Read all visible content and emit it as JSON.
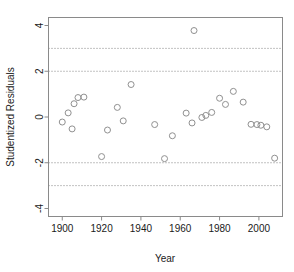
{
  "chart_data": {
    "type": "scatter",
    "title": "",
    "xlabel": "Year",
    "ylabel": "Studentized Residuals",
    "xlim": [
      1893,
      2012
    ],
    "ylim": [
      -4.35,
      4.35
    ],
    "xticks": [
      1900,
      1920,
      1940,
      1960,
      1980,
      2000
    ],
    "xtick_labels": [
      "1900",
      "1920",
      "1940",
      "1960",
      "1980",
      "2000"
    ],
    "yticks": [
      4,
      2,
      0,
      -2,
      -4
    ],
    "ytick_labels": [
      "4",
      "2",
      "0",
      "-2",
      "-4"
    ],
    "grid": false,
    "legend": null,
    "reference_lines": [
      {
        "y": 3,
        "style": "dotted",
        "color": "#777777"
      },
      {
        "y": 2,
        "style": "dotted",
        "color": "#777777"
      },
      {
        "y": -2,
        "style": "dotted",
        "color": "#777777"
      },
      {
        "y": -3,
        "style": "dotted",
        "color": "#777777"
      }
    ],
    "marker": {
      "shape": "open-circle",
      "radius_px": 3,
      "color": "#909090"
    },
    "x": [
      1900,
      1903,
      1905,
      1906,
      1908,
      1911,
      1920,
      1923,
      1928,
      1931,
      1935,
      1947,
      1952,
      1956,
      1963,
      1966,
      1967,
      1971,
      1973,
      1976,
      1980,
      1983,
      1987,
      1992,
      1996,
      1999,
      2001,
      2004,
      2008
    ],
    "y": [
      -0.22,
      0.18,
      -0.52,
      0.58,
      0.85,
      0.87,
      -1.73,
      -0.57,
      0.42,
      -0.17,
      1.42,
      -0.33,
      -1.82,
      -0.82,
      0.17,
      -0.26,
      3.78,
      -0.02,
      0.07,
      0.2,
      0.82,
      0.55,
      1.12,
      0.65,
      -0.32,
      -0.33,
      -0.36,
      -0.43,
      -1.8
    ],
    "points": [
      {
        "x": 1900,
        "y": -0.22
      },
      {
        "x": 1903,
        "y": 0.18
      },
      {
        "x": 1905,
        "y": -0.52
      },
      {
        "x": 1906,
        "y": 0.58
      },
      {
        "x": 1908,
        "y": 0.85
      },
      {
        "x": 1911,
        "y": 0.87
      },
      {
        "x": 1920,
        "y": -1.73
      },
      {
        "x": 1923,
        "y": -0.57
      },
      {
        "x": 1928,
        "y": 0.42
      },
      {
        "x": 1931,
        "y": -0.17
      },
      {
        "x": 1935,
        "y": 1.42
      },
      {
        "x": 1947,
        "y": -0.33
      },
      {
        "x": 1952,
        "y": -1.82
      },
      {
        "x": 1956,
        "y": -0.82
      },
      {
        "x": 1963,
        "y": 0.17
      },
      {
        "x": 1966,
        "y": -0.26
      },
      {
        "x": 1967,
        "y": 3.78
      },
      {
        "x": 1971,
        "y": -0.02
      },
      {
        "x": 1973,
        "y": 0.07
      },
      {
        "x": 1976,
        "y": 0.2
      },
      {
        "x": 1980,
        "y": 0.82
      },
      {
        "x": 1983,
        "y": 0.55
      },
      {
        "x": 1987,
        "y": 1.12
      },
      {
        "x": 1992,
        "y": 0.65
      },
      {
        "x": 1996,
        "y": -0.32
      },
      {
        "x": 1999,
        "y": -0.33
      },
      {
        "x": 2001,
        "y": -0.36
      },
      {
        "x": 2004,
        "y": -0.43
      },
      {
        "x": 2008,
        "y": -1.8
      }
    ]
  }
}
